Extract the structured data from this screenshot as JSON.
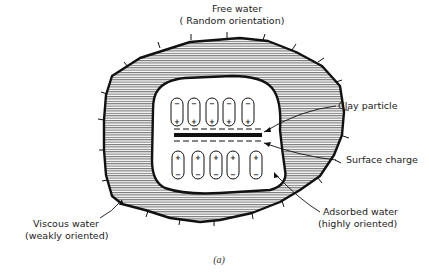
{
  "diagram": {
    "caption": "(a)",
    "labels": {
      "free_water_line1": "Free water",
      "free_water_line2": "( Random orientation)",
      "clay_particle": "Clay particle",
      "surface_charge": "Surface charge",
      "adsorbed_water_line1": "Adsorbed water",
      "adsorbed_water_line2": "(highly oriented)",
      "viscous_water_line1": "Viscous water",
      "viscous_water_line2": "(weakly oriented)"
    },
    "signs": {
      "plus": "+",
      "minus": "−"
    },
    "colors": {
      "ink": "#111111",
      "hatch": "#555555",
      "background": "#ffffff"
    }
  }
}
